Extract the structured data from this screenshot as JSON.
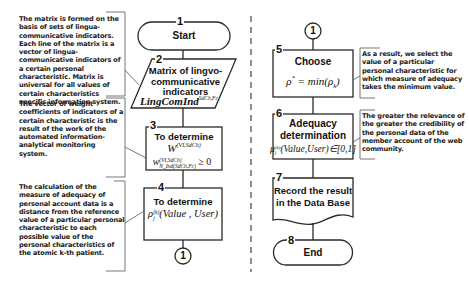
{
  "left_notes": [
    {
      "id": "note-matrix",
      "text": "The matrix is formed on the basis of sets of lingua-communicative indicators. Each line of the matrix is a vector of lingua-communicative indicators of a certain personal characteristic. Matrix is universal for all values of certain characteristics specific information system."
    },
    {
      "id": "note-vector",
      "text": "The vector of weight coefficients of indicators of a certain characteristic is the result of the work of the automated information-analytical monitoring system."
    },
    {
      "id": "note-calculation",
      "text": "The calculation of the measure of adequacy of personal account data is a distance from the reference value of a particular personal characteristic to each possible value of the personal characteristics of the atomic k-th patient."
    }
  ],
  "right_notes": [
    {
      "id": "note-result",
      "text": "As a result, we select the value of a particular personal characteristic for which measure of adequacy takes the minimum value."
    },
    {
      "id": "note-relevance",
      "text": "The greater the relevance of the greater the credibility of the personal data of the member account of the web community."
    }
  ],
  "steps": {
    "s1": {
      "number": "1",
      "label": "Start",
      "shape": "terminator"
    },
    "s2": {
      "number": "2",
      "label": "Matrix of lingvo-communicative indicators",
      "formula_main": "LingComInd",
      "formula_sup": "SdCh,Fc",
      "shape": "data"
    },
    "s3": {
      "number": "3",
      "label": "To determine",
      "formula1_main": "W",
      "formula1_sup": "(VI,SdCh)",
      "formula2_main": "w",
      "formula2_sup": "(VI,SdCh)",
      "formula2_sub": "N_Ind(SdCh,Fc)",
      "formula2_tail": "≥ 0",
      "shape": "process"
    },
    "s4": {
      "number": "4",
      "label": "To determine",
      "formula_main": "ρ",
      "formula_sup": "(k)",
      "formula_sub": "j",
      "formula_tail": "(Value , User)",
      "shape": "process"
    },
    "s5": {
      "number": "5",
      "label": "Choose",
      "formula": "ρ* = min(ρk)",
      "formula_left": "ρ",
      "formula_left_sup": "*",
      "formula_mid": " = min",
      "formula_arg": "(ρ",
      "formula_arg_sub": "k",
      "formula_close": ")",
      "shape": "process"
    },
    "s6": {
      "number": "6",
      "label": "Adequacy determination",
      "formula_main": "μ",
      "formula_sup": "(k)",
      "formula_sub": "j",
      "formula_tail": "(Value,User)∈[0,1]",
      "shape": "process"
    },
    "s7": {
      "number": "7",
      "label": "Record the result in the Data Base",
      "shape": "document"
    },
    "s8": {
      "number": "8",
      "label": "End",
      "shape": "terminator"
    }
  },
  "connectors": {
    "left_bottom": "1",
    "right_top": "1"
  },
  "colors": {
    "line": "#2a2a2a",
    "note_border": "#555555",
    "divider": "#444444",
    "background": "#ffffff"
  }
}
